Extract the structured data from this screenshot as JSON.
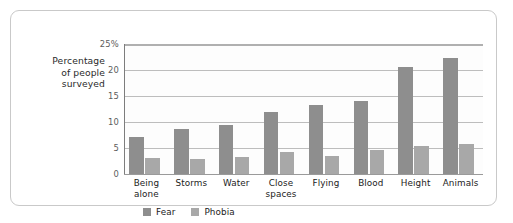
{
  "chart_data": {
    "type": "bar",
    "title": "",
    "xlabel": "",
    "ylabel": "Percentage of people surveyed",
    "ylabel_lines": [
      "Percentage",
      "of people",
      "surveyed"
    ],
    "ylim": [
      0,
      25
    ],
    "yticks": [
      0,
      5,
      10,
      15,
      20,
      25
    ],
    "ytick_labels": [
      "0",
      "5",
      "10",
      "15",
      "20",
      "25%"
    ],
    "grid": true,
    "legend_position": "bottom-left",
    "categories": [
      "Being alone",
      "Storms",
      "Water",
      "Close spaces",
      "Flying",
      "Blood",
      "Height",
      "Animals"
    ],
    "category_lines": [
      [
        "Being",
        "alone"
      ],
      [
        "Storms"
      ],
      [
        "Water"
      ],
      [
        "Close",
        "spaces"
      ],
      [
        "Flying"
      ],
      [
        "Blood"
      ],
      [
        "Height"
      ],
      [
        "Animals"
      ]
    ],
    "series": [
      {
        "name": "Fear",
        "color": "#8e8e8e",
        "values": [
          7.2,
          8.6,
          9.4,
          11.9,
          13.2,
          14.0,
          20.5,
          22.3
        ]
      },
      {
        "name": "Phobia",
        "color": "#a8a8a8",
        "values": [
          3.1,
          2.9,
          3.3,
          4.3,
          3.5,
          4.6,
          5.4,
          5.8
        ]
      }
    ]
  },
  "legend": {
    "items": [
      {
        "label": "Fear",
        "swatch": "fear-swatch"
      },
      {
        "label": "Phobia",
        "swatch": "phobia-swatch"
      }
    ]
  },
  "colors": {
    "fear": "#8e8e8e",
    "phobia": "#a8a8a8",
    "gridline": "#bdbdbd",
    "frame_border": "#c9c9c9",
    "background": "#ffffff"
  }
}
